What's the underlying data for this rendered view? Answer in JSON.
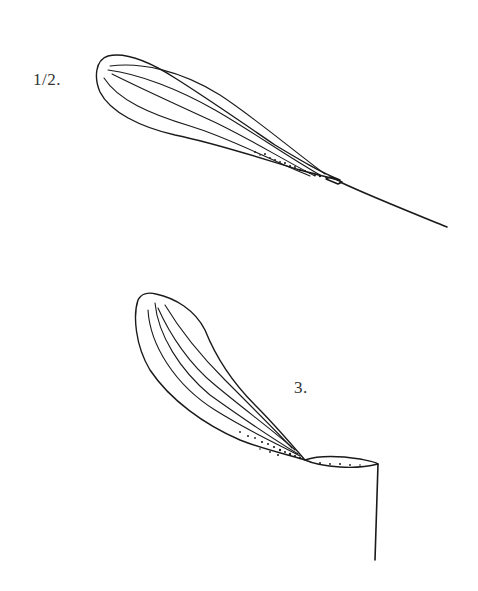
{
  "figures": [
    {
      "id": "fig-1-2",
      "label": "1/2.",
      "description": "Winged seed (samara) with long slender bristle, oriented diagonally"
    },
    {
      "id": "fig-3",
      "label": "3.",
      "description": "Winged seed with twisted body and vertical stalk"
    }
  ],
  "colors": {
    "ink": "#1a1a1a",
    "background": "#ffffff"
  }
}
